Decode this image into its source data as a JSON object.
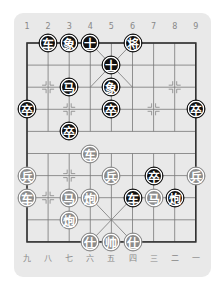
{
  "board": {
    "top_labels": [
      "1",
      "2",
      "3",
      "4",
      "5",
      "6",
      "7",
      "8",
      "9"
    ],
    "bottom_labels": [
      "九",
      "八",
      "七",
      "六",
      "五",
      "四",
      "三",
      "二",
      "一"
    ],
    "colors": {
      "background": "#e9e9e9",
      "black_piece": "#111111",
      "red_piece": "#8c8c8c",
      "line": "#777777"
    }
  },
  "pieces": [
    {
      "label": "车",
      "side": "black",
      "col": 1,
      "row": 0
    },
    {
      "label": "象",
      "side": "black",
      "col": 2,
      "row": 0
    },
    {
      "label": "士",
      "side": "black",
      "col": 3,
      "row": 0
    },
    {
      "label": "将",
      "side": "black",
      "col": 5,
      "row": 0
    },
    {
      "label": "士",
      "side": "black",
      "col": 4,
      "row": 1
    },
    {
      "label": "马",
      "side": "black",
      "col": 2,
      "row": 2
    },
    {
      "label": "象",
      "side": "black",
      "col": 4,
      "row": 2
    },
    {
      "label": "卒",
      "side": "black",
      "col": 0,
      "row": 3
    },
    {
      "label": "卒",
      "side": "black",
      "col": 4,
      "row": 3
    },
    {
      "label": "卒",
      "side": "black",
      "col": 8,
      "row": 3
    },
    {
      "label": "卒",
      "side": "black",
      "col": 2,
      "row": 4
    },
    {
      "label": "车",
      "side": "red",
      "col": 3,
      "row": 5
    },
    {
      "label": "兵",
      "side": "red",
      "col": 0,
      "row": 6
    },
    {
      "label": "兵",
      "side": "red",
      "col": 4,
      "row": 6
    },
    {
      "label": "卒",
      "side": "black",
      "col": 6,
      "row": 6
    },
    {
      "label": "兵",
      "side": "red",
      "col": 8,
      "row": 6
    },
    {
      "label": "车",
      "side": "red",
      "col": 0,
      "row": 7
    },
    {
      "label": "马",
      "side": "red",
      "col": 2,
      "row": 7
    },
    {
      "label": "炮",
      "side": "red",
      "col": 3,
      "row": 7
    },
    {
      "label": "车",
      "side": "black",
      "col": 5,
      "row": 7
    },
    {
      "label": "马",
      "side": "red",
      "col": 6,
      "row": 7
    },
    {
      "label": "炮",
      "side": "black",
      "col": 7,
      "row": 7
    },
    {
      "label": "炮",
      "side": "red",
      "col": 2,
      "row": 8
    },
    {
      "label": "仕",
      "side": "red",
      "col": 3,
      "row": 9
    },
    {
      "label": "帅",
      "side": "red",
      "col": 4,
      "row": 9
    },
    {
      "label": "仕",
      "side": "red",
      "col": 5,
      "row": 9
    }
  ]
}
